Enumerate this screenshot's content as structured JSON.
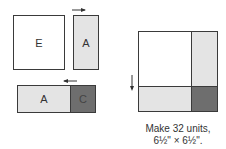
{
  "step_left": {
    "top_row": {
      "patch_e": {
        "label": "E",
        "fill": "#ffffff"
      },
      "patch_a": {
        "label": "A",
        "fill": "#e4e4e4"
      },
      "arrow": "right"
    },
    "bottom_row": {
      "patch_a": {
        "label": "A",
        "fill": "#e4e4e4"
      },
      "patch_c": {
        "label": "C",
        "fill": "#6e6e6e"
      },
      "arrow": "left"
    }
  },
  "result_block": {
    "quadrants": [
      {
        "position": "top-left",
        "fill": "#ffffff"
      },
      {
        "position": "top-right",
        "fill": "#e4e4e4"
      },
      {
        "position": "bottom-left",
        "fill": "#e4e4e4"
      },
      {
        "position": "bottom-right",
        "fill": "#6e6e6e"
      }
    ],
    "arrow": "down"
  },
  "caption": {
    "line1": "Make 32 units,",
    "line2": "6½\" × 6½\"."
  }
}
